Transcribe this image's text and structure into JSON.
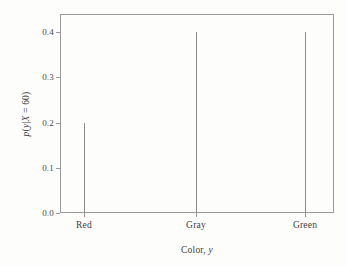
{
  "chart_data": {
    "type": "bar",
    "title": "",
    "subtitle": "",
    "categories": [
      "Red",
      "Gray",
      "Green"
    ],
    "values": [
      0.2,
      0.4,
      0.4
    ],
    "series": [
      {
        "name": "p(y|X = 60)",
        "values": [
          0.2,
          0.4,
          0.4
        ]
      }
    ],
    "xlabel": "Color, y",
    "xlabel_parts": {
      "text": "Color, ",
      "italic": "y"
    },
    "ylabel": "p(y|X = 60)",
    "ylabel_parts": {
      "italic_p": "p",
      "open": "(",
      "italic_y": "y",
      "bar": "|",
      "italic_x": "X",
      "eq": " = 60)"
    },
    "ylim": [
      0.0,
      0.44
    ],
    "yticks": [
      0.0,
      0.1,
      0.2,
      0.3,
      0.4
    ],
    "ytick_labels": [
      "0.0",
      "0.1",
      "0.2",
      "0.3",
      "0.4"
    ],
    "xtick_labels": [
      "Red",
      "Gray",
      "Green"
    ],
    "grid": false,
    "legend": false,
    "legend_position": "none",
    "annotations": [],
    "style": {
      "stem_color": "#8c8c8c",
      "frame_color": "#9a9a9a",
      "background": "#fdfdfc",
      "text_color": "#3d3d3d"
    }
  }
}
